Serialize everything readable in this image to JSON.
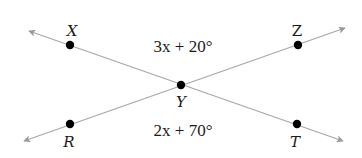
{
  "diagram": {
    "type": "intersecting-lines",
    "colors": {
      "line": "#a8a8a8",
      "arrow": "#9a9a9a",
      "point": "#000000",
      "text": "#1a1a1a",
      "background": "#ffffff"
    },
    "points": {
      "X": {
        "label": "X",
        "x": 70,
        "y": 45
      },
      "Z": {
        "label": "Z",
        "x": 298,
        "y": 45
      },
      "Y": {
        "label": "Y",
        "x": 181,
        "y": 85
      },
      "R": {
        "label": "R",
        "x": 70,
        "y": 124
      },
      "T": {
        "label": "T",
        "x": 297,
        "y": 124
      }
    },
    "lines": [
      {
        "name": "line-XT",
        "through": [
          "X",
          "Y",
          "T"
        ],
        "arrows": "both"
      },
      {
        "name": "line-RZ",
        "through": [
          "R",
          "Y",
          "Z"
        ],
        "arrows": "both"
      }
    ],
    "angles": {
      "top": {
        "label": "3x + 20°",
        "between": [
          "X",
          "Y",
          "Z"
        ]
      },
      "bottom": {
        "label": "2x + 70°",
        "between": [
          "R",
          "Y",
          "T"
        ]
      }
    }
  }
}
